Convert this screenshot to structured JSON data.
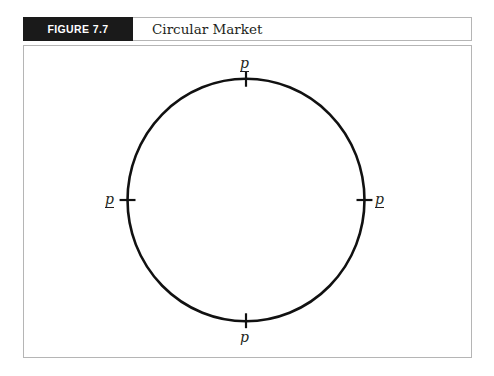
{
  "figure": {
    "tag": "FIGURE 7.7",
    "title": "Circular Market",
    "tag_background": "#1a1a1a",
    "tag_text_color": "#ffffff",
    "border_color": "#b5b5b5",
    "ink_color": "#231f20"
  },
  "diagram": {
    "shape": "circle",
    "stroke_color": "#111111",
    "center": {
      "x": 246,
      "y": 200
    },
    "radius_x": 119,
    "radius_y": 122,
    "tick_count": 4,
    "labels": {
      "top": {
        "text": "p",
        "underlined": true,
        "position": "top"
      },
      "left": {
        "text": "p",
        "underlined": true,
        "position": "left"
      },
      "right": {
        "text": "p",
        "underlined": true,
        "position": "right"
      },
      "bottom": {
        "text": "p",
        "underlined": false,
        "position": "bottom"
      }
    }
  }
}
